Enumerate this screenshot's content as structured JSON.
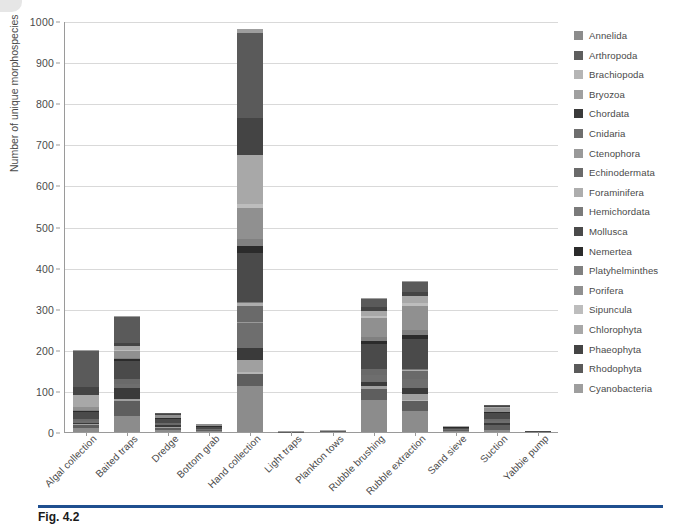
{
  "figure": {
    "caption_label": "Fig. 4.2",
    "corner_icon": "page-corner-mark"
  },
  "chart_data": {
    "type": "bar",
    "stacked": true,
    "title": "",
    "xlabel": "",
    "ylabel": "Number of unique morphospecies",
    "ylim": [
      0,
      1000
    ],
    "ytick_step": 100,
    "yticks": [
      0,
      100,
      200,
      300,
      400,
      500,
      600,
      700,
      800,
      900,
      1000
    ],
    "grid": true,
    "legend_position": "right",
    "categories": [
      "Algal collection",
      "Baited traps",
      "Dredge",
      "Bottom grab",
      "Hand collection",
      "Light traps",
      "Plankton tows",
      "Rubble brushing",
      "Rubble extraction",
      "Sand sieve",
      "Suction",
      "Yabbie pump"
    ],
    "totals": [
      200,
      283,
      45,
      20,
      982,
      2,
      5,
      325,
      368,
      14,
      65,
      2
    ],
    "series": [
      {
        "name": "Annelida",
        "color": "#8c8c8c",
        "values": [
          10,
          40,
          4,
          2,
          112,
          0,
          0,
          78,
          52,
          3,
          6,
          1
        ]
      },
      {
        "name": "Arthropoda",
        "color": "#5e5e5e",
        "values": [
          8,
          36,
          6,
          3,
          30,
          1,
          2,
          26,
          24,
          2,
          10,
          0
        ]
      },
      {
        "name": "Brachiopoda",
        "color": "#b5b5b5",
        "values": [
          0,
          0,
          0,
          0,
          3,
          0,
          0,
          1,
          2,
          0,
          0,
          0
        ]
      },
      {
        "name": "Bryozoa",
        "color": "#a0a0a0",
        "values": [
          2,
          4,
          2,
          0,
          30,
          0,
          0,
          6,
          14,
          0,
          2,
          0
        ]
      },
      {
        "name": "Chordata",
        "color": "#3a3a3a",
        "values": [
          2,
          28,
          4,
          0,
          30,
          0,
          0,
          10,
          16,
          0,
          4,
          0
        ]
      },
      {
        "name": "Cnidaria",
        "color": "#6e6e6e",
        "values": [
          6,
          10,
          2,
          1,
          60,
          0,
          0,
          18,
          22,
          0,
          4,
          0
        ]
      },
      {
        "name": "Ctenophora",
        "color": "#999999",
        "values": [
          0,
          0,
          0,
          0,
          2,
          0,
          1,
          0,
          0,
          0,
          0,
          0
        ]
      },
      {
        "name": "Echinodermata",
        "color": "#6a6a6a",
        "values": [
          4,
          10,
          4,
          2,
          40,
          0,
          0,
          14,
          18,
          1,
          6,
          0
        ]
      },
      {
        "name": "Foraminifera",
        "color": "#adadad",
        "values": [
          0,
          0,
          0,
          0,
          6,
          0,
          0,
          0,
          4,
          0,
          0,
          0
        ]
      },
      {
        "name": "Hemichordata",
        "color": "#7a7a7a",
        "values": [
          0,
          0,
          0,
          0,
          3,
          0,
          0,
          1,
          2,
          0,
          0,
          0
        ]
      },
      {
        "name": "Mollusca",
        "color": "#4a4a4a",
        "values": [
          18,
          45,
          10,
          5,
          120,
          0,
          0,
          60,
          72,
          4,
          14,
          1
        ]
      },
      {
        "name": "Nemertea",
        "color": "#2b2b2b",
        "values": [
          2,
          4,
          1,
          1,
          16,
          0,
          0,
          8,
          10,
          1,
          2,
          0
        ]
      },
      {
        "name": "Platyhelminthes",
        "color": "#808080",
        "values": [
          2,
          4,
          1,
          1,
          18,
          0,
          0,
          10,
          12,
          0,
          2,
          0
        ]
      },
      {
        "name": "Porifera",
        "color": "#909090",
        "values": [
          6,
          16,
          6,
          3,
          75,
          0,
          0,
          46,
          58,
          1,
          8,
          0
        ]
      },
      {
        "name": "Sipuncula",
        "color": "#bdbdbd",
        "values": [
          0,
          2,
          0,
          0,
          10,
          0,
          0,
          5,
          8,
          0,
          1,
          0
        ]
      },
      {
        "name": "Chlorophyta",
        "color": "#a8a8a8",
        "values": [
          30,
          10,
          1,
          0,
          120,
          0,
          1,
          12,
          18,
          1,
          2,
          0
        ]
      },
      {
        "name": "Phaeophyta",
        "color": "#444444",
        "values": [
          20,
          8,
          1,
          0,
          90,
          0,
          0,
          8,
          10,
          0,
          1,
          0
        ]
      },
      {
        "name": "Rhodophyta",
        "color": "#5a5a5a",
        "values": [
          88,
          62,
          3,
          2,
          205,
          0,
          0,
          20,
          24,
          1,
          3,
          0
        ]
      },
      {
        "name": "Cyanobacteria",
        "color": "#9e9e9e",
        "values": [
          2,
          4,
          0,
          0,
          12,
          1,
          1,
          2,
          2,
          0,
          0,
          0
        ]
      }
    ]
  },
  "legend": {
    "items": [
      {
        "label": "Annelida",
        "color": "#8c8c8c"
      },
      {
        "label": "Arthropoda",
        "color": "#5e5e5e"
      },
      {
        "label": "Brachiopoda",
        "color": "#b5b5b5"
      },
      {
        "label": "Bryozoa",
        "color": "#a0a0a0"
      },
      {
        "label": "Chordata",
        "color": "#3a3a3a"
      },
      {
        "label": "Cnidaria",
        "color": "#6e6e6e"
      },
      {
        "label": "Ctenophora",
        "color": "#999999"
      },
      {
        "label": "Echinodermata",
        "color": "#6a6a6a"
      },
      {
        "label": "Foraminifera",
        "color": "#adadad"
      },
      {
        "label": "Hemichordata",
        "color": "#7a7a7a"
      },
      {
        "label": "Mollusca",
        "color": "#4a4a4a"
      },
      {
        "label": "Nemertea",
        "color": "#2b2b2b"
      },
      {
        "label": "Platyhelminthes",
        "color": "#808080"
      },
      {
        "label": "Porifera",
        "color": "#909090"
      },
      {
        "label": "Sipuncula",
        "color": "#bdbdbd"
      },
      {
        "label": "Chlorophyta",
        "color": "#a8a8a8"
      },
      {
        "label": "Phaeophyta",
        "color": "#444444"
      },
      {
        "label": "Rhodophyta",
        "color": "#5a5a5a"
      },
      {
        "label": "Cyanobacteria",
        "color": "#9e9e9e"
      }
    ]
  },
  "colors": {
    "axis": "#9a9a9a",
    "grid": "#d9d9d9",
    "text": "#4a4a4a",
    "caption_rule": "#1f4f8f"
  }
}
